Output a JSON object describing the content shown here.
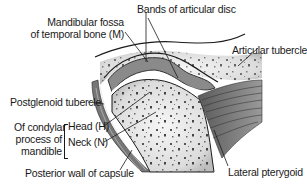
{
  "diagram": {
    "labels": {
      "mandibular_fossa_line1": "Mandibular fossa",
      "mandibular_fossa_line2": "of temporal bone (M)",
      "bands_of_disc": "Bands of articular disc",
      "articular_tubercle": "Articular tubercle",
      "postglenoid_tubercle": "Postglenoid tubercle",
      "condylar_line1": "Of condylar",
      "condylar_line2": "process of",
      "condylar_line3": "mandible",
      "head": "Head (H)",
      "neck": "Neck (N)",
      "posterior_wall": "Posterior wall of capsule",
      "lateral_pterygoid": "Lateral pterygoid"
    },
    "colors": {
      "bone_fill": "#f2f2f2",
      "bone_speckle": "#555555",
      "disc": "#8a8a8a",
      "muscle": "#6e6e6e",
      "outline": "#1a1a1a"
    }
  }
}
